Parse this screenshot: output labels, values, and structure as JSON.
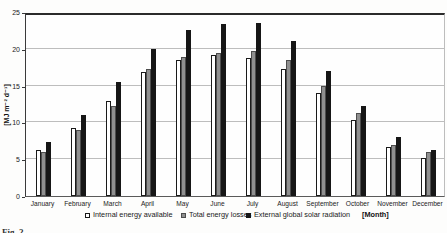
{
  "caption_fragment": "Fig. 2",
  "chart_data": {
    "type": "bar",
    "title": "",
    "ylabel": "[MJ m⁻² d⁻¹]",
    "xlabel": "[Month]",
    "ylim": [
      0,
      25
    ],
    "yticks": [
      0,
      5,
      10,
      15,
      20,
      25
    ],
    "grid": true,
    "legend_position": "bottom",
    "categories": [
      "January",
      "February",
      "March",
      "April",
      "May",
      "June",
      "July",
      "August",
      "September",
      "October",
      "November",
      "December"
    ],
    "series": [
      {
        "name": "Internal energy available",
        "color": "#ffffff",
        "border": "#1a1a1a",
        "values": [
          6.3,
          9.2,
          12.9,
          16.8,
          18.5,
          19.1,
          18.7,
          17.2,
          14.0,
          10.3,
          6.7,
          5.1
        ]
      },
      {
        "name": "Total energy losses",
        "color": "#8f8f8f",
        "border": "#4d4d4d",
        "values": [
          6.0,
          9.0,
          12.2,
          17.3,
          18.9,
          19.4,
          19.7,
          18.5,
          15.0,
          11.3,
          6.9,
          6.0
        ]
      },
      {
        "name": "External global solar radiation",
        "color": "#161616",
        "border": "#161616",
        "values": [
          7.4,
          11.0,
          15.5,
          20.0,
          22.5,
          23.4,
          23.5,
          21.0,
          17.0,
          12.2,
          8.0,
          6.2
        ]
      }
    ]
  }
}
